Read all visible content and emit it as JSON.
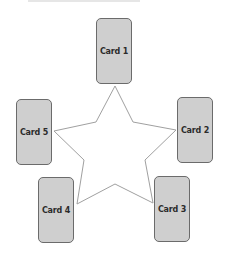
{
  "diagram": {
    "type": "star-spread",
    "cards": [
      {
        "label": "Card 1",
        "x": 96,
        "y": 18
      },
      {
        "label": "Card 2",
        "x": 177,
        "y": 97
      },
      {
        "label": "Card 3",
        "x": 154,
        "y": 176
      },
      {
        "label": "Card 4",
        "x": 38,
        "y": 177
      },
      {
        "label": "Card 5",
        "x": 16,
        "y": 99
      }
    ],
    "colors": {
      "card_fill": "#cfcfcf",
      "card_border": "#6b6b6b",
      "star_stroke": "#a0a0a0"
    }
  }
}
